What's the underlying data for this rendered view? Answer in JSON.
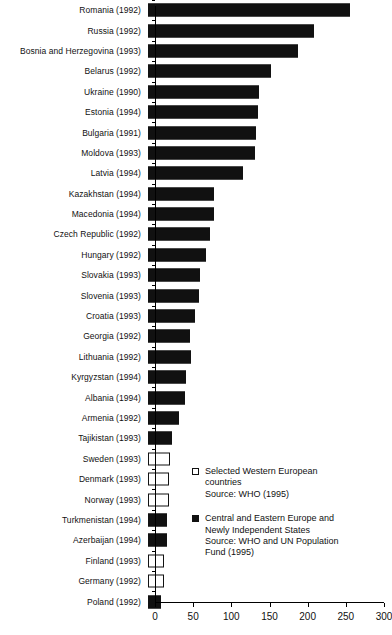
{
  "chart_data": {
    "type": "bar",
    "orientation": "horizontal",
    "title": "",
    "xlabel": "",
    "ylabel": "",
    "xlim": [
      0,
      300
    ],
    "xticks": [
      0,
      50,
      100,
      150,
      200,
      250,
      300
    ],
    "grid": false,
    "categories": [
      "Romania (1992)",
      "Russia (1992)",
      "Bosnia and Herzegovina (1993)",
      "Belarus (1992)",
      "Ukraine (1990)",
      "Estonia (1994)",
      "Bulgaria (1991)",
      "Moldova (1993)",
      "Latvia (1994)",
      "Kazakhstan (1994)",
      "Macedonia (1994)",
      "Czech Republic (1992)",
      "Hungary (1992)",
      "Slovakia (1993)",
      "Slovenia (1993)",
      "Croatia (1993)",
      "Georgia (1992)",
      "Lithuania (1992)",
      "Kyrgyzstan (1994)",
      "Albania (1994)",
      "Armenia (1992)",
      "Tajikistan (1993)",
      "Sweden (1993)",
      "Denmark (1993)",
      "Norway (1993)",
      "Turkmenistan (1994)",
      "Azerbaijan (1994)",
      "Finland (1993)",
      "Germany (1992)",
      "Poland (1992)"
    ],
    "values": [
      265,
      217,
      196,
      161,
      146,
      144,
      141,
      140,
      124,
      86,
      86,
      81,
      76,
      68,
      67,
      62,
      55,
      56,
      50,
      49,
      41,
      31,
      29,
      27,
      27,
      25,
      25,
      21,
      21,
      17
    ],
    "groups": [
      "east",
      "east",
      "east",
      "east",
      "east",
      "east",
      "east",
      "east",
      "east",
      "east",
      "east",
      "east",
      "east",
      "east",
      "east",
      "east",
      "east",
      "east",
      "east",
      "east",
      "east",
      "east",
      "west",
      "west",
      "west",
      "east",
      "east",
      "west",
      "west",
      "east"
    ],
    "series": [
      {
        "name": "Selected Western European countries",
        "style": "white-outlined",
        "color": "#ffffff"
      },
      {
        "name": "Central and Eastern Europe and Newly Independent States",
        "style": "solid-black",
        "color": "#111111"
      }
    ]
  },
  "legend": {
    "position": "inside-lower-right",
    "entries": [
      {
        "swatch": "white-square",
        "lines": [
          "Selected Western European",
          "countries",
          "Source: WHO (1995)"
        ]
      },
      {
        "swatch": "black-square",
        "lines": [
          "Central and Eastern Europe and",
          "Newly Independent States",
          "Source: WHO and UN Population",
          "Fund (1995)"
        ]
      }
    ]
  },
  "axis": {
    "tick_labels": [
      "0",
      "50",
      "100",
      "150",
      "200",
      "250",
      "300"
    ]
  },
  "colors": {
    "bar_dark": "#111111",
    "bar_light": "#ffffff",
    "axis": "#000000",
    "text": "#111111",
    "background": "#ffffff"
  }
}
